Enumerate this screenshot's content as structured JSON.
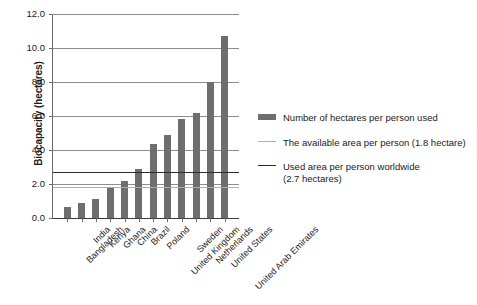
{
  "chart_data": {
    "type": "bar",
    "title": "",
    "xlabel": "",
    "ylabel": "Biocapacity (hectares)",
    "ylim": [
      0.0,
      12.0
    ],
    "ytick_step": 2.0,
    "ytick_labels": [
      "0.0",
      "2.0",
      "4.0",
      "6.0",
      "8.0",
      "10.0",
      "12.0"
    ],
    "grid": "horizontal",
    "legend_position": "right",
    "categories": [
      "Bangladesh",
      "India",
      "Kenya",
      "Ghana",
      "China",
      "Brazil",
      "Poland",
      "United Kingdom",
      "Sweden",
      "Netherlands",
      "United States",
      "United Arab Emirates"
    ],
    "values": [
      0.65,
      0.9,
      1.1,
      1.8,
      2.2,
      2.9,
      4.35,
      4.9,
      5.85,
      6.2,
      8.0,
      10.7
    ],
    "series": [
      {
        "name": "Number of hectares per person used",
        "values": [
          0.65,
          0.9,
          1.1,
          1.8,
          2.2,
          2.9,
          4.35,
          4.9,
          5.85,
          6.2,
          8.0,
          10.7
        ],
        "color": "#6e6e6e"
      }
    ],
    "reference_lines": [
      {
        "name": "The available area per person (1.8 hectare)",
        "value": 1.8,
        "color": "#adadad"
      },
      {
        "name": "Used area per person worldwide (2.7 hectares)",
        "value": 2.7,
        "color": "#2b2b2b"
      }
    ],
    "legend": [
      {
        "type": "bar",
        "label": "Number of hectares per person used",
        "color": "#6e6e6e"
      },
      {
        "type": "line-light",
        "label": "The available area per person (1.8 hectare)",
        "color": "#adadad"
      },
      {
        "type": "line-dark",
        "label": "Used area per person worldwide\n(2.7 hectares)",
        "color": "#2b2b2b"
      }
    ]
  },
  "legend": {
    "items": [
      {
        "label": "Number of hectares per person used"
      },
      {
        "label": "The available area per person (1.8 hectare)"
      },
      {
        "label_line1": "Used area per person worldwide",
        "label_line2": "(2.7 hectares)"
      }
    ]
  },
  "axes": {
    "y_title": "Biocapacity (hectares)"
  }
}
